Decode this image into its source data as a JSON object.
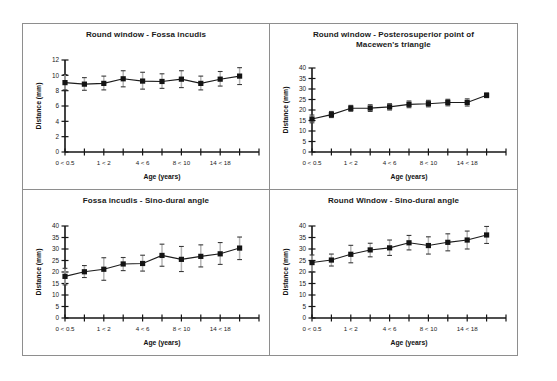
{
  "figure": {
    "axis_title_x": "Age (years)",
    "axis_title_y": "Distance (mm)",
    "line_color": "#1c1c1c",
    "marker_color": "#141414",
    "errorbar_color": "#b6b6b6",
    "frame_color": "#8e8e8e"
  },
  "chart_data": [
    {
      "type": "line",
      "panel": 0,
      "title": "Round window - Fossa incudis",
      "xlabel": "Age (years)",
      "ylabel": "Distance (mm)",
      "ylim": [
        0,
        12
      ],
      "yticks": [
        0,
        2,
        4,
        6,
        8,
        10,
        12
      ],
      "ytick_labels": [
        "0",
        "2",
        "4",
        "6",
        "8",
        "10",
        "12"
      ],
      "grid": false,
      "legend": "none",
      "categories": [
        "0 < 0.5",
        "",
        "1 < 2",
        "",
        "4 < 6",
        "",
        "8 < 10",
        "",
        "14 < 18",
        ""
      ],
      "xtick_labels": [
        "0 < 0.5",
        "",
        "1 < 2",
        "",
        "4 < 6",
        "",
        "8 < 10",
        "",
        "14 < 18",
        "",
        ""
      ],
      "values": [
        9.05,
        8.85,
        8.95,
        9.55,
        9.25,
        9.2,
        9.5,
        8.95,
        9.5,
        9.9
      ],
      "err_low": [
        8.1,
        8.05,
        8.1,
        8.5,
        8.2,
        8.3,
        8.4,
        8.1,
        8.6,
        8.8
      ],
      "err_high": [
        10.1,
        9.7,
        9.9,
        10.6,
        10.4,
        10.2,
        10.6,
        9.9,
        10.5,
        11.0
      ]
    },
    {
      "type": "line",
      "panel": 1,
      "title": "Round window - Posterosuperior point of Macewen's triangle",
      "title_line1": "Round window - Posterosuperior point of",
      "title_line2": "Macewen's triangle",
      "xlabel": "Age (years)",
      "ylabel": "Distance (mm)",
      "ylim": [
        0,
        40
      ],
      "yticks": [
        0,
        5,
        10,
        15,
        20,
        25,
        30,
        35,
        40
      ],
      "ytick_labels": [
        "0",
        "5",
        "10",
        "15",
        "20",
        "25",
        "30",
        "35",
        "40"
      ],
      "grid": false,
      "legend": "none",
      "categories": [
        "0 < 0.5",
        "",
        "1 < 2",
        "",
        "4 < 6",
        "",
        "8 < 10",
        "",
        "14 < 18",
        ""
      ],
      "xtick_labels": [
        "0 < 0.5",
        "",
        "1 < 2",
        "",
        "4 < 6",
        "",
        "8 < 10",
        "",
        "14 < 18",
        "",
        ""
      ],
      "values": [
        15.7,
        17.8,
        20.8,
        20.9,
        21.5,
        22.7,
        23.0,
        23.6,
        23.6,
        27.0
      ],
      "err_low": [
        13.9,
        16.4,
        19.4,
        19.3,
        20.0,
        21.1,
        21.5,
        22.0,
        21.9,
        25.9
      ],
      "err_high": [
        17.6,
        19.3,
        22.2,
        22.5,
        23.0,
        24.3,
        24.6,
        25.1,
        25.3,
        28.1
      ]
    },
    {
      "type": "line",
      "panel": 2,
      "title": "Fossa incudis - Sino-dural angle",
      "xlabel": "Age (years)",
      "ylabel": "Distance (mm)",
      "ylim": [
        0,
        40
      ],
      "yticks": [
        0,
        5,
        10,
        15,
        20,
        25,
        30,
        35,
        40
      ],
      "ytick_labels": [
        "0",
        "5",
        "10",
        "15",
        "20",
        "25",
        "30",
        "35",
        "40"
      ],
      "grid": false,
      "legend": "none",
      "categories": [
        "0 < 0.5",
        "",
        "1 < 2",
        "",
        "4 < 6",
        "",
        "8 < 10",
        "",
        "14 < 18",
        ""
      ],
      "xtick_labels": [
        "0 < 0.5",
        "",
        "1 < 2",
        "",
        "4 < 6",
        "",
        "8 < 10",
        "",
        "14 < 18",
        "",
        ""
      ],
      "values": [
        18.1,
        20.1,
        21.2,
        23.5,
        23.7,
        27.2,
        25.5,
        26.8,
        27.9,
        30.4
      ],
      "err_low": [
        14.4,
        17.6,
        16.4,
        20.6,
        20.4,
        22.5,
        20.2,
        22.2,
        23.3,
        25.4
      ],
      "err_high": [
        21.6,
        22.8,
        26.2,
        26.3,
        27.3,
        32.1,
        31.1,
        31.8,
        32.8,
        35.2
      ]
    },
    {
      "type": "line",
      "panel": 3,
      "title": "Round Window - Sino-dural angle",
      "xlabel": "Age (years)",
      "ylabel": "Distance (mm)",
      "ylim": [
        0,
        40
      ],
      "yticks": [
        0,
        5,
        10,
        15,
        20,
        25,
        30,
        35,
        40
      ],
      "ytick_labels": [
        "0",
        "5",
        "10",
        "15",
        "20",
        "25",
        "30",
        "35",
        "40"
      ],
      "grid": false,
      "legend": "none",
      "categories": [
        "0 < 0.5",
        "",
        "1 < 2",
        "",
        "4 < 6",
        "",
        "8 < 10",
        "",
        "14 < 18",
        ""
      ],
      "xtick_labels": [
        "0 < 0.5",
        "",
        "1 < 2",
        "",
        "4 < 6",
        "",
        "8 < 10",
        "",
        "14 < 18",
        "",
        ""
      ],
      "values": [
        24.1,
        25.2,
        27.7,
        29.6,
        30.5,
        32.7,
        31.5,
        32.9,
        33.9,
        36.1
      ],
      "err_low": [
        20.1,
        22.6,
        24.0,
        26.6,
        27.2,
        29.6,
        27.8,
        29.2,
        30.0,
        32.4
      ],
      "err_high": [
        27.4,
        27.8,
        31.6,
        32.5,
        33.9,
        35.9,
        35.3,
        36.6,
        37.8,
        39.8
      ]
    }
  ]
}
